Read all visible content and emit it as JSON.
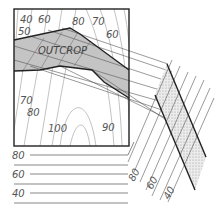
{
  "figure": {
    "type": "geologic outcrop projection diagram",
    "colors": {
      "outcrop_fill": "#c4c4c4",
      "contour_line": "#9a9a9a",
      "bold_line": "#222222",
      "label": "#555555",
      "stipple": "#d6d6d6"
    }
  },
  "map": {
    "outcrop_label": "OUTCROP",
    "contour_labels": [
      {
        "text": "40",
        "x": 22,
        "y": 22
      },
      {
        "text": "60",
        "x": 40,
        "y": 22
      },
      {
        "text": "50",
        "x": 20,
        "y": 34
      },
      {
        "text": "80",
        "x": 70,
        "y": 24
      },
      {
        "text": "70",
        "x": 92,
        "y": 24
      },
      {
        "text": "60",
        "x": 106,
        "y": 36
      },
      {
        "text": "70",
        "x": 20,
        "y": 104
      },
      {
        "text": "80",
        "x": 28,
        "y": 116
      },
      {
        "text": "100",
        "x": 48,
        "y": 132
      },
      {
        "text": "90",
        "x": 100,
        "y": 132
      }
    ]
  },
  "elevation_scale": {
    "horizontal_labels": [
      "80",
      "60",
      "40"
    ],
    "diagonal_labels": [
      "80",
      "60",
      "40"
    ]
  }
}
